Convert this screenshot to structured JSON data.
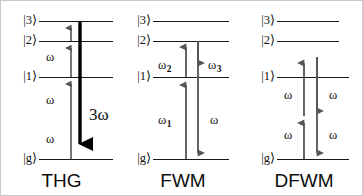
{
  "figure": {
    "width": 363,
    "height": 196,
    "background": "#ffffff",
    "line_color": "#1a1a1a",
    "arrow_gray": "#555555",
    "arrow_black": "#000000"
  },
  "panels": [
    {
      "id": "thg",
      "name": "THG",
      "levels": [
        {
          "id": "l3",
          "label": "|3⟩",
          "y": 20
        },
        {
          "id": "l2",
          "label": "|2⟩",
          "y": 40
        },
        {
          "id": "l1",
          "label": "|1⟩",
          "y": 76
        },
        {
          "id": "lg",
          "label": "|g⟩",
          "y": 158
        }
      ],
      "transitions": [
        {
          "id": "t1",
          "label": "ω",
          "direction": "up",
          "from": "lg",
          "to": "l1",
          "style": "thin-gray"
        },
        {
          "id": "t2",
          "label": "ω",
          "direction": "up",
          "from": "l1",
          "to": "l2",
          "style": "thin-gray"
        },
        {
          "id": "t3",
          "label": "ω",
          "direction": "up",
          "from": "l2",
          "to": "l3",
          "style": "thin-gray"
        },
        {
          "id": "t4",
          "label": "3ω",
          "direction": "down",
          "from": "l3",
          "to": "lg",
          "style": "thick-black"
        }
      ]
    },
    {
      "id": "fwm",
      "name": "FWM",
      "levels": [
        {
          "id": "l3",
          "label": "|3⟩",
          "y": 20
        },
        {
          "id": "l2",
          "label": "|2⟩",
          "y": 40
        },
        {
          "id": "l1",
          "label": "|1⟩",
          "y": 76
        },
        {
          "id": "lg",
          "label": "|g⟩",
          "y": 158
        }
      ],
      "transitions": [
        {
          "id": "t1",
          "label": "ω",
          "sub": "1",
          "direction": "up",
          "from": "lg",
          "to": "l1",
          "style": "thin-gray"
        },
        {
          "id": "t2",
          "label": "ω",
          "sub": "2",
          "direction": "up",
          "from": "l1",
          "to": "l2",
          "style": "thin-gray"
        },
        {
          "id": "t3",
          "label": "ω",
          "sub": "3",
          "direction": "down",
          "from": "l2",
          "to": "l1",
          "style": "thin-gray"
        },
        {
          "id": "t4",
          "label": "ω",
          "sub": "",
          "direction": "down",
          "from": "l2",
          "to": "lg",
          "style": "thin-gray"
        }
      ]
    },
    {
      "id": "dfwm",
      "name": "DFWM",
      "levels": [
        {
          "id": "l3",
          "label": "|3⟩",
          "y": 20
        },
        {
          "id": "l2",
          "label": "|2⟩",
          "y": 40
        },
        {
          "id": "l1",
          "label": "|1⟩",
          "y": 76
        },
        {
          "id": "lg",
          "label": "|g⟩",
          "y": 158
        }
      ],
      "transitions": [
        {
          "id": "t1",
          "label": "ω",
          "direction": "up",
          "from": "lg",
          "to": "l1",
          "style": "thin-gray"
        },
        {
          "id": "t2",
          "label": "ω",
          "direction": "up",
          "from": "l1",
          "to": "l2",
          "style": "thin-gray"
        },
        {
          "id": "t3",
          "label": "ω",
          "direction": "down",
          "from": "l2",
          "to": "l1",
          "style": "thin-gray"
        },
        {
          "id": "t4",
          "label": "ω",
          "direction": "down",
          "from": "l1",
          "to": "lg",
          "style": "thin-gray"
        }
      ]
    }
  ],
  "labels": {
    "thg": {
      "level_3": "|3⟩",
      "level_2": "|2⟩",
      "level_1": "|1⟩",
      "level_g": "|g⟩",
      "omega_low": "ω",
      "omega_mid": "ω",
      "omega_high": "ω",
      "three_omega": "3ω",
      "process": "THG"
    },
    "fwm": {
      "level_3": "|3⟩",
      "level_2": "|2⟩",
      "level_1": "|1⟩",
      "level_g": "|g⟩",
      "omega1": "ω",
      "omega1_sub": "1",
      "omega2": "ω",
      "omega2_sub": "2",
      "omega3": "ω",
      "omega3_sub": "3",
      "omega_out": "ω",
      "process": "FWM"
    },
    "dfwm": {
      "level_3": "|3⟩",
      "level_2": "|2⟩",
      "level_1": "|1⟩",
      "level_g": "|g⟩",
      "omega_up_low": "ω",
      "omega_up_high": "ω",
      "omega_down_high": "ω",
      "omega_down_low": "ω",
      "process": "DFWM"
    }
  }
}
